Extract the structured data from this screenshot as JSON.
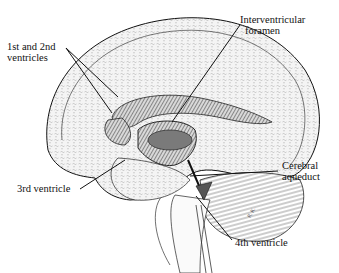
{
  "figure": {
    "colors": {
      "ink": "#111111",
      "stipple": "#8a8a8a",
      "fill": "#f2f2f2",
      "ventricle": "#5a5a5a",
      "background": "#ffffff"
    }
  },
  "labels": {
    "lateral": {
      "line1": "1st and 2nd",
      "line2": "ventricles"
    },
    "interventricular": {
      "line1": "Interventricular",
      "line2": "foramen"
    },
    "third": {
      "line1": "3rd ventricle"
    },
    "aqueduct": {
      "line1": "Cerebral",
      "line2": "aqueduct"
    },
    "fourth": {
      "line1": "4th ventricle"
    }
  }
}
